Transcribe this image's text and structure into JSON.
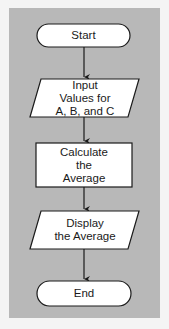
{
  "diagram": {
    "type": "flowchart",
    "colors": {
      "background": "#f4f4f4",
      "panel": "#b8b8b8",
      "shape_fill": "#ffffff",
      "stroke": "#1a1a1a"
    },
    "nodes": [
      {
        "id": "start",
        "shape": "terminal",
        "label": "Start"
      },
      {
        "id": "input",
        "shape": "parallelogram",
        "label": "Input\nValues for\nA, B, and C"
      },
      {
        "id": "calculate",
        "shape": "rectangle",
        "label": "Calculate\nthe\nAverage"
      },
      {
        "id": "display",
        "shape": "parallelogram",
        "label": "Display\nthe Average"
      },
      {
        "id": "end",
        "shape": "terminal",
        "label": "End"
      }
    ],
    "edges": [
      {
        "from": "start",
        "to": "input"
      },
      {
        "from": "input",
        "to": "calculate"
      },
      {
        "from": "calculate",
        "to": "display"
      },
      {
        "from": "display",
        "to": "end"
      }
    ]
  }
}
